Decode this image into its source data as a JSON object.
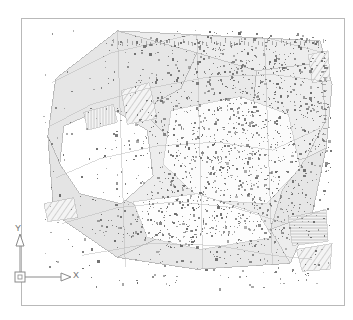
{
  "app": {
    "kind": "cad-drawing-viewport",
    "title": "",
    "background_color": "#ffffff"
  },
  "viewport": {
    "name": "model-space-viewport",
    "frame_color": "#b9b9b9",
    "background_color": "#ffffff"
  },
  "ucs_icon": {
    "name": "ucs-coordinate-icon",
    "x_axis_label": "X",
    "y_axis_label": "Y",
    "stroke_color": "#8a8a8a",
    "origin_marker": "square"
  },
  "drawing": {
    "description": "Topographic survey site plan",
    "parcel_fill_light": "#ededed",
    "parcel_fill_mid": "#e3e3e3",
    "parcel_fill_pale": "#f4f4f4",
    "line_color": "#a9a9a9",
    "hatch_color": "#b5b5b5",
    "point_symbol_color": "#6b6b6b",
    "point_symbol_count": 2400
  },
  "chart_data": {
    "type": "scatter",
    "title": "",
    "xlabel": "X",
    "ylabel": "Y",
    "grid": false,
    "legend": null
  }
}
